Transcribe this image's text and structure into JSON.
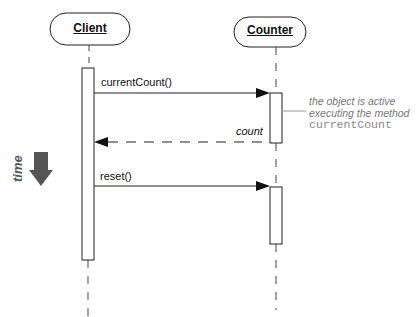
{
  "diagram": {
    "type": "uml-sequence",
    "objects": [
      {
        "name": "Client"
      },
      {
        "name": "Counter"
      }
    ],
    "messages": [
      {
        "label": "currentCount()",
        "from": "Client",
        "to": "Counter",
        "kind": "call"
      },
      {
        "label": "count",
        "from": "Counter",
        "to": "Client",
        "kind": "return"
      },
      {
        "label": "reset()",
        "from": "Client",
        "to": "Counter",
        "kind": "call"
      }
    ],
    "note": {
      "line1": "the object is active",
      "line2": "executing the method",
      "method": "currentCount"
    },
    "time_label": "time",
    "colors": {
      "line": "#111111",
      "note": "#777777",
      "time_arrow": "#555555"
    }
  }
}
